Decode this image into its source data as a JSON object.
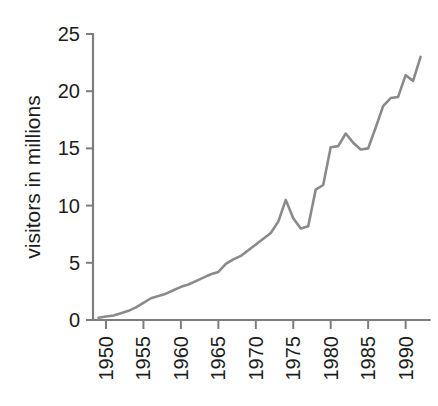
{
  "chart_data": {
    "type": "line",
    "title": "",
    "subtitle": "",
    "xlabel": "",
    "ylabel": "visitors in millions",
    "xlim": [
      1949,
      1992
    ],
    "ylim": [
      0,
      25
    ],
    "grid": false,
    "legend": false,
    "legend_position": "none",
    "line_color": "#8a8a8a",
    "axis_color": "#7d7d7d",
    "text_color": "#1c1c1c",
    "background_color": "#ffffff",
    "x_tick_labels": [
      "1950",
      "1955",
      "1960",
      "1965",
      "1970",
      "1975",
      "1980",
      "1985",
      "1990"
    ],
    "x_tick_values": [
      1950,
      1955,
      1960,
      1965,
      1970,
      1975,
      1980,
      1985,
      1990
    ],
    "x_tick_rotation": 90,
    "y_tick_labels": [
      "0",
      "5",
      "10",
      "15",
      "20",
      "25"
    ],
    "y_tick_values": [
      0,
      5,
      10,
      15,
      20,
      25
    ],
    "series": [
      {
        "name": "visitors",
        "x": [
          1949,
          1950,
          1951,
          1952,
          1953,
          1954,
          1955,
          1956,
          1957,
          1958,
          1959,
          1960,
          1961,
          1962,
          1963,
          1964,
          1965,
          1966,
          1967,
          1968,
          1969,
          1970,
          1971,
          1972,
          1973,
          1974,
          1975,
          1976,
          1977,
          1978,
          1979,
          1980,
          1981,
          1982,
          1983,
          1984,
          1985,
          1986,
          1987,
          1988,
          1989,
          1990,
          1991,
          1992
        ],
        "values": [
          0.2,
          0.3,
          0.4,
          0.6,
          0.8,
          1.1,
          1.5,
          1.9,
          2.1,
          2.3,
          2.6,
          2.9,
          3.1,
          3.4,
          3.7,
          4.0,
          4.2,
          4.9,
          5.3,
          5.6,
          6.1,
          6.6,
          7.1,
          7.6,
          8.6,
          10.5,
          8.9,
          8.0,
          8.2,
          11.4,
          11.8,
          15.1,
          15.2,
          16.3,
          15.5,
          14.9,
          15.0,
          16.8,
          18.7,
          19.4,
          19.5,
          21.4,
          20.9,
          23.0
        ]
      }
    ]
  }
}
